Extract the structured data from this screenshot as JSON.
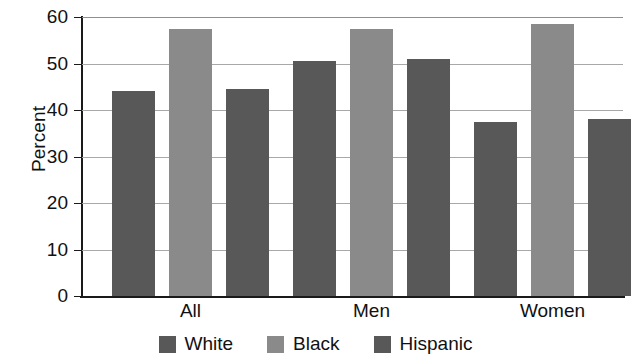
{
  "chart_data": {
    "type": "bar",
    "title": "",
    "subtitle": "",
    "xlabel": "",
    "ylabel": "Percent",
    "categories": [
      "All",
      "Men",
      "Women"
    ],
    "series": [
      {
        "name": "White",
        "color": "#585858",
        "values": [
          44,
          50.5,
          37.5
        ]
      },
      {
        "name": "Black",
        "color": "#8a8a8a",
        "values": [
          57.5,
          57.5,
          58.5
        ]
      },
      {
        "name": "Hispanic",
        "color": "#585858",
        "values": [
          44.5,
          51,
          38
        ]
      }
    ],
    "ylim": [
      0,
      60
    ],
    "yticks": [
      0,
      10,
      20,
      30,
      40,
      50,
      60
    ],
    "ytick_labels": [
      "0",
      "10",
      "20",
      "30",
      "40",
      "50",
      "60"
    ],
    "grid": true,
    "grid_axis": "y",
    "legend_position": "bottom"
  }
}
